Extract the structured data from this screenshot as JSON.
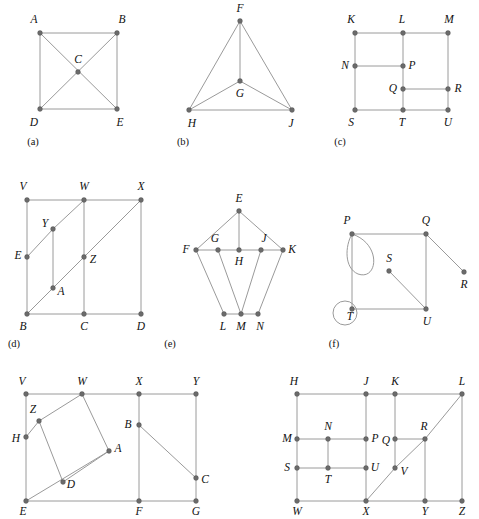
{
  "page": {
    "background_color": "#ffffff",
    "edge_color": "#9a9a9a",
    "vertex_color": "#6b6b6b",
    "label_color": "#111111"
  },
  "panels": [
    {
      "id": "a",
      "caption": "(a)",
      "caption_pos": [
        33,
        143
      ],
      "vertices": [
        {
          "label": "A",
          "x": 40,
          "y": 33,
          "lx": 34,
          "ly": 20
        },
        {
          "label": "B",
          "x": 117,
          "y": 33,
          "lx": 122,
          "ly": 20
        },
        {
          "label": "C",
          "x": 78,
          "y": 72,
          "lx": 78,
          "ly": 60
        },
        {
          "label": "D",
          "x": 40,
          "y": 109,
          "lx": 34,
          "ly": 123
        },
        {
          "label": "E",
          "x": 117,
          "y": 109,
          "lx": 120,
          "ly": 123
        }
      ],
      "edges": [
        [
          "A",
          "B"
        ],
        [
          "A",
          "D"
        ],
        [
          "B",
          "E"
        ],
        [
          "D",
          "E"
        ],
        [
          "A",
          "E"
        ],
        [
          "B",
          "D"
        ]
      ],
      "loops": []
    },
    {
      "id": "b",
      "caption": "(b)",
      "caption_pos": [
        183,
        143
      ],
      "vertices": [
        {
          "label": "F",
          "x": 240,
          "y": 21,
          "lx": 240,
          "ly": 9
        },
        {
          "label": "G",
          "x": 240,
          "y": 81,
          "lx": 240,
          "ly": 94
        },
        {
          "label": "H",
          "x": 189,
          "y": 110,
          "lx": 192,
          "ly": 124
        },
        {
          "label": "J",
          "x": 292,
          "y": 110,
          "lx": 291,
          "ly": 124
        }
      ],
      "edges": [
        [
          "F",
          "H"
        ],
        [
          "F",
          "J"
        ],
        [
          "F",
          "G"
        ],
        [
          "G",
          "H"
        ],
        [
          "G",
          "J"
        ],
        [
          "H",
          "J"
        ]
      ],
      "loops": []
    },
    {
      "id": "c",
      "caption": "(c)",
      "caption_pos": [
        340,
        143
      ],
      "vertices": [
        {
          "label": "K",
          "x": 355,
          "y": 33,
          "lx": 351,
          "ly": 20
        },
        {
          "label": "L",
          "x": 403,
          "y": 33,
          "lx": 402,
          "ly": 20
        },
        {
          "label": "M",
          "x": 448,
          "y": 33,
          "lx": 449,
          "ly": 20
        },
        {
          "label": "N",
          "x": 355,
          "y": 66,
          "lx": 345,
          "ly": 66
        },
        {
          "label": "P",
          "x": 403,
          "y": 66,
          "lx": 412,
          "ly": 66
        },
        {
          "label": "Q",
          "x": 403,
          "y": 89,
          "lx": 393,
          "ly": 89
        },
        {
          "label": "R",
          "x": 448,
          "y": 89,
          "lx": 458,
          "ly": 89
        },
        {
          "label": "S",
          "x": 355,
          "y": 110,
          "lx": 351,
          "ly": 123
        },
        {
          "label": "T",
          "x": 403,
          "y": 110,
          "lx": 402,
          "ly": 123
        },
        {
          "label": "U",
          "x": 448,
          "y": 110,
          "lx": 448,
          "ly": 123
        }
      ],
      "edges": [
        [
          "K",
          "L"
        ],
        [
          "L",
          "M"
        ],
        [
          "K",
          "N"
        ],
        [
          "N",
          "S"
        ],
        [
          "L",
          "P"
        ],
        [
          "P",
          "Q"
        ],
        [
          "Q",
          "T"
        ],
        [
          "M",
          "R"
        ],
        [
          "R",
          "U"
        ],
        [
          "N",
          "P"
        ],
        [
          "Q",
          "R"
        ],
        [
          "S",
          "T"
        ],
        [
          "T",
          "U"
        ]
      ],
      "loops": []
    },
    {
      "id": "d",
      "caption": "(d)",
      "caption_pos": [
        14,
        345
      ],
      "vertices": [
        {
          "label": "V",
          "x": 27,
          "y": 200,
          "lx": 23,
          "ly": 187
        },
        {
          "label": "W",
          "x": 84,
          "y": 200,
          "lx": 84,
          "ly": 187
        },
        {
          "label": "X",
          "x": 141,
          "y": 200,
          "lx": 141,
          "ly": 187
        },
        {
          "label": "Y",
          "x": 53,
          "y": 229,
          "lx": 45,
          "ly": 224
        },
        {
          "label": "E",
          "x": 27,
          "y": 257,
          "lx": 18,
          "ly": 256
        },
        {
          "label": "Z",
          "x": 84,
          "y": 257,
          "lx": 93,
          "ly": 260
        },
        {
          "label": "A",
          "x": 53,
          "y": 288,
          "lx": 61,
          "ly": 292
        },
        {
          "label": "B",
          "x": 27,
          "y": 314,
          "lx": 23,
          "ly": 327
        },
        {
          "label": "C",
          "x": 84,
          "y": 314,
          "lx": 84,
          "ly": 327
        },
        {
          "label": "D",
          "x": 141,
          "y": 314,
          "lx": 141,
          "ly": 327
        }
      ],
      "edges": [
        [
          "V",
          "W"
        ],
        [
          "W",
          "X"
        ],
        [
          "V",
          "E"
        ],
        [
          "E",
          "B"
        ],
        [
          "W",
          "Z"
        ],
        [
          "Z",
          "C"
        ],
        [
          "X",
          "D"
        ],
        [
          "B",
          "C"
        ],
        [
          "C",
          "D"
        ],
        [
          "E",
          "Y"
        ],
        [
          "Y",
          "W"
        ],
        [
          "B",
          "A"
        ],
        [
          "A",
          "Z"
        ],
        [
          "Z",
          "X"
        ],
        [
          "Y",
          "A"
        ]
      ],
      "loops": []
    },
    {
      "id": "e",
      "caption": "(e)",
      "caption_pos": [
        170,
        345
      ],
      "vertices": [
        {
          "label": "E",
          "x": 239,
          "y": 211,
          "lx": 239,
          "ly": 199
        },
        {
          "label": "F",
          "x": 196,
          "y": 250,
          "lx": 186,
          "ly": 250
        },
        {
          "label": "G",
          "x": 218,
          "y": 250,
          "lx": 215,
          "ly": 239
        },
        {
          "label": "H",
          "x": 239,
          "y": 250,
          "lx": 239,
          "ly": 262
        },
        {
          "label": "J",
          "x": 261,
          "y": 250,
          "lx": 264,
          "ly": 239
        },
        {
          "label": "K",
          "x": 283,
          "y": 250,
          "lx": 292,
          "ly": 250
        },
        {
          "label": "L",
          "x": 224,
          "y": 314,
          "lx": 223,
          "ly": 327
        },
        {
          "label": "M",
          "x": 241,
          "y": 314,
          "lx": 241,
          "ly": 327
        },
        {
          "label": "N",
          "x": 258,
          "y": 314,
          "lx": 260,
          "ly": 327
        }
      ],
      "edges": [
        [
          "E",
          "F"
        ],
        [
          "E",
          "H"
        ],
        [
          "E",
          "K"
        ],
        [
          "F",
          "G"
        ],
        [
          "G",
          "H"
        ],
        [
          "H",
          "J"
        ],
        [
          "J",
          "K"
        ],
        [
          "F",
          "L"
        ],
        [
          "G",
          "M"
        ],
        [
          "J",
          "M"
        ],
        [
          "K",
          "N"
        ],
        [
          "L",
          "M"
        ],
        [
          "M",
          "N"
        ]
      ],
      "loops": []
    },
    {
      "id": "f",
      "caption": "(f)",
      "caption_pos": [
        334,
        345
      ],
      "vertices": [
        {
          "label": "P",
          "x": 352,
          "y": 234,
          "lx": 347,
          "ly": 221
        },
        {
          "label": "Q",
          "x": 426,
          "y": 234,
          "lx": 426,
          "ly": 221
        },
        {
          "label": "R",
          "x": 464,
          "y": 272,
          "lx": 464,
          "ly": 285
        },
        {
          "label": "S",
          "x": 389,
          "y": 271,
          "lx": 389,
          "ly": 259
        },
        {
          "label": "T",
          "x": 352,
          "y": 309,
          "lx": 350,
          "ly": 317
        },
        {
          "label": "U",
          "x": 426,
          "y": 309,
          "lx": 427,
          "ly": 322
        }
      ],
      "edges": [
        [
          "P",
          "Q"
        ],
        [
          "Q",
          "R"
        ],
        [
          "Q",
          "U"
        ],
        [
          "P",
          "T"
        ],
        [
          "T",
          "U"
        ],
        [
          "S",
          "U"
        ]
      ],
      "loops": [
        {
          "at": "P",
          "type": "teardrop",
          "d": "M 352 234 C 382 244 378 281 358 274 C 344 268 345 246 352 234 Z"
        },
        {
          "at": "T",
          "type": "circle",
          "cx": 345,
          "cy": 313,
          "r": 12
        }
      ]
    },
    {
      "id": "g",
      "caption": "",
      "caption_pos": [
        0,
        0
      ],
      "vertices": [
        {
          "label": "V",
          "x": 26,
          "y": 394,
          "lx": 22,
          "ly": 382
        },
        {
          "label": "W",
          "x": 82,
          "y": 394,
          "lx": 82,
          "ly": 382
        },
        {
          "label": "X",
          "x": 139,
          "y": 394,
          "lx": 139,
          "ly": 382
        },
        {
          "label": "Y",
          "x": 196,
          "y": 394,
          "lx": 196,
          "ly": 382
        },
        {
          "label": "Z",
          "x": 39,
          "y": 421,
          "lx": 33,
          "ly": 410
        },
        {
          "label": "H",
          "x": 26,
          "y": 437,
          "lx": 16,
          "ly": 439
        },
        {
          "label": "B",
          "x": 139,
          "y": 425,
          "lx": 128,
          "ly": 425
        },
        {
          "label": "A",
          "x": 109,
          "y": 451,
          "lx": 118,
          "ly": 449
        },
        {
          "label": "C",
          "x": 196,
          "y": 478,
          "lx": 205,
          "ly": 480
        },
        {
          "label": "D",
          "x": 63,
          "y": 482,
          "lx": 71,
          "ly": 485
        },
        {
          "label": "E",
          "x": 26,
          "y": 501,
          "lx": 23,
          "ly": 512
        },
        {
          "label": "F",
          "x": 139,
          "y": 501,
          "lx": 139,
          "ly": 512
        },
        {
          "label": "G",
          "x": 196,
          "y": 501,
          "lx": 196,
          "ly": 512
        }
      ],
      "edges": [
        [
          "V",
          "W"
        ],
        [
          "W",
          "X"
        ],
        [
          "X",
          "Y"
        ],
        [
          "V",
          "H"
        ],
        [
          "H",
          "E"
        ],
        [
          "E",
          "F"
        ],
        [
          "F",
          "G"
        ],
        [
          "X",
          "B"
        ],
        [
          "B",
          "F"
        ],
        [
          "Y",
          "C"
        ],
        [
          "C",
          "G"
        ],
        [
          "B",
          "C"
        ],
        [
          "Z",
          "W"
        ],
        [
          "W",
          "A"
        ],
        [
          "A",
          "D"
        ],
        [
          "D",
          "Z"
        ],
        [
          "H",
          "Z"
        ],
        [
          "E",
          "A"
        ]
      ],
      "loops": []
    },
    {
      "id": "h",
      "caption": "",
      "caption_pos": [
        0,
        0
      ],
      "vertices": [
        {
          "label": "H",
          "x": 297,
          "y": 394,
          "lx": 294,
          "ly": 382
        },
        {
          "label": "J",
          "x": 366,
          "y": 394,
          "lx": 366,
          "ly": 382
        },
        {
          "label": "K",
          "x": 395,
          "y": 394,
          "lx": 395,
          "ly": 382
        },
        {
          "label": "L",
          "x": 462,
          "y": 394,
          "lx": 462,
          "ly": 382
        },
        {
          "label": "M",
          "x": 297,
          "y": 439,
          "lx": 287,
          "ly": 439
        },
        {
          "label": "N",
          "x": 328,
          "y": 439,
          "lx": 328,
          "ly": 427
        },
        {
          "label": "P",
          "x": 366,
          "y": 439,
          "lx": 375,
          "ly": 439
        },
        {
          "label": "Q",
          "x": 395,
          "y": 439,
          "lx": 386,
          "ly": 441
        },
        {
          "label": "R",
          "x": 425,
          "y": 439,
          "lx": 424,
          "ly": 427
        },
        {
          "label": "S",
          "x": 297,
          "y": 468,
          "lx": 287,
          "ly": 468
        },
        {
          "label": "T",
          "x": 328,
          "y": 468,
          "lx": 328,
          "ly": 480
        },
        {
          "label": "U",
          "x": 366,
          "y": 468,
          "lx": 375,
          "ly": 468
        },
        {
          "label": "V",
          "x": 395,
          "y": 468,
          "lx": 404,
          "ly": 472
        },
        {
          "label": "W",
          "x": 297,
          "y": 501,
          "lx": 297,
          "ly": 512
        },
        {
          "label": "X",
          "x": 366,
          "y": 501,
          "lx": 366,
          "ly": 512
        },
        {
          "label": "Y",
          "x": 425,
          "y": 501,
          "lx": 425,
          "ly": 512
        },
        {
          "label": "Z",
          "x": 462,
          "y": 501,
          "lx": 462,
          "ly": 512
        }
      ],
      "edges": [
        [
          "H",
          "J"
        ],
        [
          "J",
          "K"
        ],
        [
          "K",
          "L"
        ],
        [
          "H",
          "M"
        ],
        [
          "M",
          "S"
        ],
        [
          "S",
          "W"
        ],
        [
          "J",
          "P"
        ],
        [
          "P",
          "U"
        ],
        [
          "U",
          "X"
        ],
        [
          "K",
          "Q"
        ],
        [
          "Q",
          "V"
        ],
        [
          "L",
          "Z"
        ],
        [
          "M",
          "N"
        ],
        [
          "N",
          "P"
        ],
        [
          "S",
          "T"
        ],
        [
          "T",
          "U"
        ],
        [
          "N",
          "T"
        ],
        [
          "Q",
          "R"
        ],
        [
          "R",
          "Y"
        ],
        [
          "W",
          "X"
        ],
        [
          "X",
          "Y"
        ],
        [
          "Y",
          "Z"
        ],
        [
          "X",
          "V"
        ],
        [
          "V",
          "R"
        ],
        [
          "R",
          "L"
        ]
      ],
      "loops": []
    }
  ]
}
